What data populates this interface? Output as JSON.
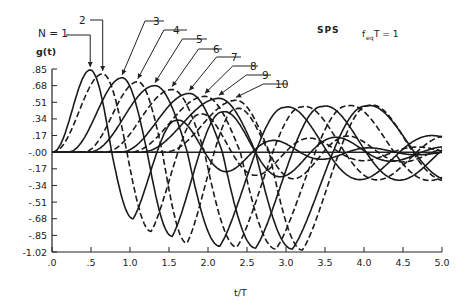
{
  "chart_data": {
    "type": "line",
    "title": "SPS",
    "annotation": "f_eq T = 1",
    "annotation_main": "f",
    "annotation_sub": "eq",
    "annotation_rest": "T = 1",
    "xlabel": "t/T",
    "ylabel": "g(t)",
    "xlim": [
      0,
      5.0
    ],
    "ylim": [
      -1.02,
      0.85
    ],
    "grid": false,
    "legend_position": "none (curves labeled with callout arrows)",
    "x_ticks": [
      0,
      0.5,
      1.0,
      1.5,
      2.0,
      2.5,
      3.0,
      3.5,
      4.0,
      4.5,
      5.0
    ],
    "x_tick_labels": [
      ".0",
      ".5",
      "1.0",
      "1.5",
      "2.0",
      "2.5",
      "3.0",
      "3.5",
      "4.0",
      "4.5",
      "5.0"
    ],
    "y_ticks": [
      0.85,
      0.68,
      0.51,
      0.34,
      0.17,
      0.0,
      -0.17,
      -0.34,
      -0.51,
      -0.68,
      -0.85,
      -1.02
    ],
    "y_tick_labels": [
      ".85",
      ".68",
      ".51",
      ".34",
      ".17",
      "-.00",
      "-.17",
      "-.34",
      "-.51",
      "-.68",
      "-.85",
      "-1.02"
    ],
    "series": [
      {
        "name": "N = 1",
        "label": "N = 1",
        "style": "solid",
        "first_peak": {
          "x": 0.49,
          "y": 0.84
        },
        "first_trough": {
          "x": 1.04,
          "y": -0.68
        },
        "zero_cross": 0.8
      },
      {
        "name": "N = 2",
        "label": "2",
        "style": "dashed",
        "first_peak": {
          "x": 0.65,
          "y": 0.8
        },
        "first_trough": {
          "x": 1.27,
          "y": -0.81
        },
        "zero_cross": 1.0
      },
      {
        "name": "N = 3",
        "label": "3",
        "style": "solid",
        "first_peak": {
          "x": 0.9,
          "y": 0.76
        },
        "first_trough": {
          "x": 1.54,
          "y": -0.86
        },
        "zero_cross": 1.22
      },
      {
        "name": "N = 4",
        "label": "4",
        "style": "dashed",
        "first_peak": {
          "x": 1.1,
          "y": 0.72
        },
        "first_trough": {
          "x": 1.73,
          "y": -0.93
        },
        "zero_cross": 1.42
      },
      {
        "name": "N = 5",
        "label": "5",
        "style": "solid",
        "first_peak": {
          "x": 1.32,
          "y": 0.68
        },
        "first_trough": {
          "x": 2.15,
          "y": -0.96
        },
        "zero_cross": 1.72
      },
      {
        "name": "N = 6",
        "label": "6",
        "style": "dashed",
        "first_peak": {
          "x": 1.54,
          "y": 0.64
        },
        "first_trough": {
          "x": 2.37,
          "y": -0.97
        },
        "zero_cross": 1.95
      },
      {
        "name": "N = 7",
        "label": "7",
        "style": "solid",
        "first_peak": {
          "x": 1.76,
          "y": 0.6
        },
        "first_trough": {
          "x": 2.61,
          "y": -0.98
        },
        "zero_cross": 2.18
      },
      {
        "name": "N = 8",
        "label": "8",
        "style": "dashed",
        "first_peak": {
          "x": 1.96,
          "y": 0.57
        },
        "first_trough": {
          "x": 2.87,
          "y": -0.99
        },
        "zero_cross": 2.42
      },
      {
        "name": "N = 9",
        "label": "9",
        "style": "solid",
        "first_peak": {
          "x": 2.14,
          "y": 0.55
        },
        "first_trough": {
          "x": 3.08,
          "y": -0.99
        },
        "zero_cross": 2.62
      },
      {
        "name": "N = 10",
        "label": "10",
        "style": "dashed",
        "first_peak": {
          "x": 2.36,
          "y": 0.53
        },
        "first_trough": {
          "x": 3.21,
          "y": -1.0
        },
        "zero_cross": 2.8
      }
    ]
  },
  "labels": {
    "title": "SPS",
    "annotation_main": "f",
    "annotation_sub": "eq",
    "annotation_rest": "T  = 1",
    "xlabel": "t/T",
    "ylabel": "g(t)",
    "n1": "N = 1",
    "n2": "2",
    "n3": "3",
    "n4": "4",
    "n5": "5",
    "n6": "6",
    "n7": "7",
    "n8": "8",
    "n9": "9",
    "n10": "10"
  }
}
